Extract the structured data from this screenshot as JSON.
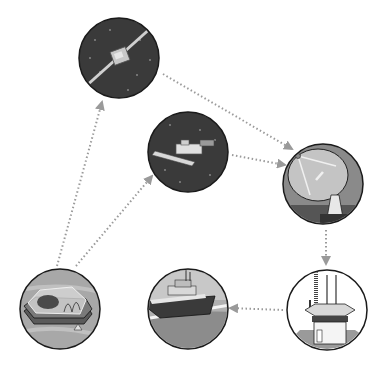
{
  "diagram": {
    "title": "",
    "colors": {
      "space": "#3a3a3a",
      "outline": "#1a1a1a",
      "arrow": "#9a9a9a",
      "water": "#9c9c9c",
      "sky": "#d8d8d8",
      "dish": "#c4c4c4"
    },
    "nodes": [
      {
        "id": "geo-satellite",
        "icon": "satellite-icon",
        "cx": 119,
        "cy": 58,
        "r": 40
      },
      {
        "id": "polar-satellite",
        "icon": "space-station-icon",
        "cx": 188,
        "cy": 152,
        "r": 40
      },
      {
        "id": "ground-station",
        "icon": "satellite-dish-icon",
        "cx": 323,
        "cy": 184,
        "r": 40
      },
      {
        "id": "coordination-center",
        "icon": "control-tower-icon",
        "cx": 327,
        "cy": 310,
        "r": 40
      },
      {
        "id": "lifeboat",
        "icon": "rescue-boat-icon",
        "cx": 188,
        "cy": 309,
        "r": 40
      },
      {
        "id": "liferaft",
        "icon": "liferaft-icon",
        "cx": 60,
        "cy": 309,
        "r": 40
      }
    ],
    "edges": [
      {
        "from": "liferaft",
        "to": "geo-satellite"
      },
      {
        "from": "liferaft",
        "to": "polar-satellite"
      },
      {
        "from": "geo-satellite",
        "to": "ground-station"
      },
      {
        "from": "polar-satellite",
        "to": "ground-station"
      },
      {
        "from": "ground-station",
        "to": "coordination-center"
      },
      {
        "from": "coordination-center",
        "to": "lifeboat"
      }
    ]
  }
}
